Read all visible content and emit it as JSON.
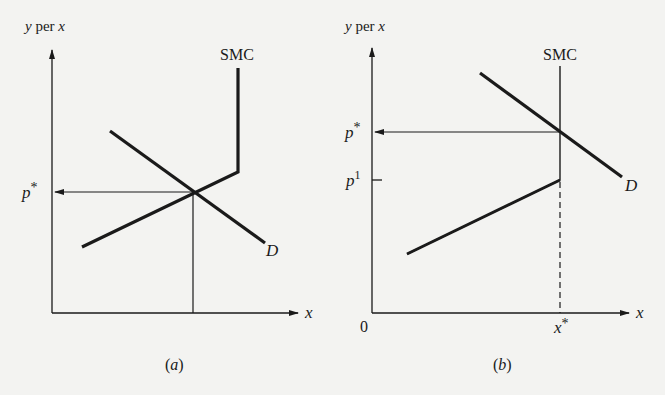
{
  "panels": [
    {
      "id": "a",
      "caption": "(a)",
      "y_axis_label_var": "y",
      "y_axis_label_mid": " per ",
      "y_axis_label_unit": "x",
      "x_axis_label": "x",
      "supply_label": "SMC",
      "demand_label": "D",
      "price_label": "p",
      "price_sup": "*"
    },
    {
      "id": "b",
      "caption": "(b)",
      "y_axis_label_var": "y",
      "y_axis_label_mid": " per ",
      "y_axis_label_unit": "x",
      "x_axis_label": "x",
      "supply_label": "SMC",
      "demand_label": "D",
      "price_label": "p",
      "price_sup": "*",
      "p1_label": "p",
      "p1_sup": "1",
      "origin_label": "0",
      "xstar_label": "x",
      "xstar_sup": "*"
    }
  ],
  "colors": {
    "background": "#f3f3f1",
    "ink": "#1a1a1a"
  }
}
